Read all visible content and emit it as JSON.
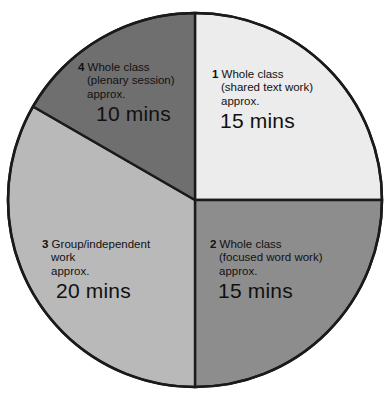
{
  "figure": {
    "type": "pie-chart",
    "background_color": "#ffffff",
    "outline_color": "#1a1a1a"
  },
  "chart_data": {
    "type": "pie",
    "title": "",
    "xlabel": "",
    "ylabel": "",
    "unit": "mins",
    "total": 60,
    "start_angle_deg": 0,
    "direction": "clockwise",
    "legend": "none (labels drawn inside slices)",
    "grid": false,
    "categories": [
      "Whole class (shared text work)",
      "Whole class (focused word work)",
      "Group/independent work",
      "Whole class (plenary session)"
    ],
    "values": [
      15,
      15,
      20,
      10
    ],
    "colors": [
      "#ececec",
      "#8d8d8d",
      "#b9b9b9",
      "#6f6f6f"
    ],
    "slices": [
      {
        "index": "1",
        "head": "Whole class",
        "sub": "(shared text work)",
        "approx": "approx.",
        "time": "15 mins",
        "value": 15,
        "color": "#ececec",
        "start_deg": 0,
        "end_deg": 90
      },
      {
        "index": "2",
        "head": "Whole class",
        "sub": "(focused word work)",
        "approx": "approx.",
        "time": "15 mins",
        "value": 15,
        "color": "#8d8d8d",
        "start_deg": 90,
        "end_deg": 180
      },
      {
        "index": "3",
        "head": "Group/independent",
        "sub": "work",
        "approx": "approx.",
        "time": "20 mins",
        "value": 20,
        "color": "#b9b9b9",
        "start_deg": 180,
        "end_deg": 300
      },
      {
        "index": "4",
        "head": "Whole class",
        "sub": "(plenary session)",
        "approx": "approx.",
        "time": "10 mins",
        "value": 10,
        "color": "#6f6f6f",
        "start_deg": 300,
        "end_deg": 360
      }
    ]
  }
}
